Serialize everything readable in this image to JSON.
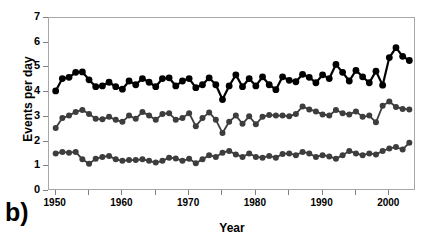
{
  "panel": {
    "letter": "b)"
  },
  "chart_data": {
    "type": "line",
    "title": "",
    "xlabel": "Year",
    "ylabel": "Events per day",
    "xlim": [
      1949,
      2004
    ],
    "ylim": [
      0,
      7
    ],
    "yticks": [
      0,
      1,
      2,
      3,
      4,
      5,
      6,
      7
    ],
    "xticks": [
      1950,
      1955,
      1960,
      1965,
      1970,
      1975,
      1980,
      1985,
      1990,
      1995,
      2000
    ],
    "xticklabels": [
      "1950",
      "",
      "1960",
      "",
      "1970",
      "",
      "1980",
      "",
      "1990",
      "",
      "2000"
    ],
    "grid": false,
    "legend": "none",
    "frame_color": "#a8a8a8",
    "x": [
      1950,
      1951,
      1952,
      1953,
      1954,
      1955,
      1956,
      1957,
      1958,
      1959,
      1960,
      1961,
      1962,
      1963,
      1964,
      1965,
      1966,
      1967,
      1968,
      1969,
      1970,
      1971,
      1972,
      1973,
      1974,
      1975,
      1976,
      1977,
      1978,
      1979,
      1980,
      1981,
      1982,
      1983,
      1984,
      1985,
      1986,
      1987,
      1988,
      1989,
      1990,
      1991,
      1992,
      1993,
      1994,
      1995,
      1996,
      1997,
      1998,
      1999,
      2000,
      2001,
      2002,
      2003
    ],
    "series": [
      {
        "name": "upper",
        "color": "#000000",
        "marker": "circle",
        "linewidth": 2.2,
        "markersize": 3.4,
        "values": [
          4.05,
          4.55,
          4.6,
          4.8,
          4.82,
          4.5,
          4.22,
          4.25,
          4.4,
          4.22,
          4.12,
          4.45,
          4.3,
          4.55,
          4.4,
          4.22,
          4.55,
          4.58,
          4.25,
          4.45,
          4.55,
          4.18,
          4.3,
          4.58,
          4.3,
          3.7,
          4.25,
          4.7,
          4.22,
          4.55,
          4.25,
          4.62,
          4.3,
          4.1,
          4.62,
          4.48,
          4.42,
          4.72,
          4.6,
          4.38,
          4.7,
          4.55,
          5.12,
          4.8,
          4.45,
          4.88,
          4.62,
          4.38,
          4.85,
          4.28,
          5.4,
          5.8,
          5.45,
          5.28
        ]
      },
      {
        "name": "middle",
        "color": "#3d3d3d",
        "marker": "circle",
        "linewidth": 1.8,
        "markersize": 3.0,
        "values": [
          2.55,
          2.95,
          3.05,
          3.2,
          3.28,
          3.12,
          2.92,
          2.9,
          3.0,
          2.88,
          2.8,
          3.05,
          2.92,
          3.2,
          3.05,
          2.88,
          3.12,
          3.15,
          2.88,
          2.95,
          3.15,
          2.62,
          2.95,
          3.18,
          2.88,
          2.35,
          2.8,
          3.05,
          2.72,
          3.02,
          2.7,
          3.0,
          3.08,
          3.05,
          3.05,
          3.02,
          3.12,
          3.42,
          3.3,
          3.22,
          3.1,
          3.05,
          3.28,
          3.15,
          3.1,
          3.22,
          3.0,
          3.05,
          2.78,
          3.45,
          3.62,
          3.4,
          3.32,
          3.3
        ]
      },
      {
        "name": "lower",
        "color": "#3d3d3d",
        "marker": "circle",
        "linewidth": 1.8,
        "markersize": 3.0,
        "values": [
          1.52,
          1.58,
          1.55,
          1.58,
          1.28,
          1.1,
          1.3,
          1.38,
          1.42,
          1.28,
          1.22,
          1.25,
          1.25,
          1.28,
          1.22,
          1.15,
          1.22,
          1.35,
          1.32,
          1.22,
          1.3,
          1.12,
          1.28,
          1.45,
          1.38,
          1.55,
          1.62,
          1.48,
          1.38,
          1.52,
          1.38,
          1.35,
          1.42,
          1.35,
          1.5,
          1.52,
          1.45,
          1.58,
          1.52,
          1.38,
          1.45,
          1.4,
          1.3,
          1.45,
          1.62,
          1.52,
          1.45,
          1.52,
          1.48,
          1.62,
          1.72,
          1.78,
          1.68,
          1.95
        ]
      }
    ]
  }
}
